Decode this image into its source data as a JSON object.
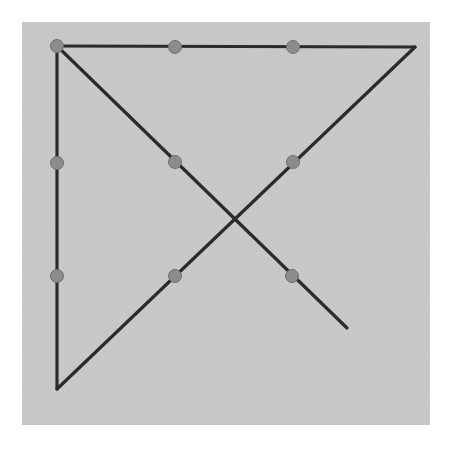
{
  "figure": {
    "canvas": {
      "width": 463,
      "height": 450,
      "background": "#ffffff"
    },
    "panel": {
      "x": 22,
      "y": 22,
      "width": 408,
      "height": 403,
      "fill": "#c9c9c9",
      "noise_opacity": 0.18
    },
    "style": {
      "line_color": "#2b2b2b",
      "line_width": 3.2,
      "dot_color": "#8c8c8c",
      "dot_stroke": "#6e6e6e",
      "dot_radius": 6.5
    },
    "segments": [
      {
        "name": "left-vertical-line",
        "x1": 57,
        "y1": 46,
        "x2": 57,
        "y2": 389
      },
      {
        "name": "top-horizontal-line",
        "x1": 56,
        "y1": 46,
        "x2": 415,
        "y2": 47
      },
      {
        "name": "main-diagonal-ne-sw",
        "x1": 415,
        "y1": 47,
        "x2": 57,
        "y2": 389
      },
      {
        "name": "cross-diagonal-nw-se",
        "x1": 57,
        "y1": 46,
        "x2": 347,
        "y2": 328
      }
    ],
    "points": [
      {
        "name": "point-top-left-corner",
        "cx": 57,
        "cy": 46,
        "label": "P1"
      },
      {
        "name": "point-top-mid-left",
        "cx": 175,
        "cy": 47,
        "label": "P2"
      },
      {
        "name": "point-top-mid-right",
        "cx": 293,
        "cy": 47,
        "label": "P3"
      },
      {
        "name": "point-left-upper",
        "cx": 57,
        "cy": 163,
        "label": "P4"
      },
      {
        "name": "point-left-lower",
        "cx": 57,
        "cy": 276,
        "label": "P5"
      },
      {
        "name": "point-inner-upper-left",
        "cx": 175,
        "cy": 162,
        "label": "P6"
      },
      {
        "name": "point-inner-upper-right",
        "cx": 293,
        "cy": 162,
        "label": "P7"
      },
      {
        "name": "point-inner-lower-left",
        "cx": 175,
        "cy": 276,
        "label": "P8"
      },
      {
        "name": "point-inner-lower-right",
        "cx": 292,
        "cy": 276,
        "label": "P9"
      }
    ]
  }
}
